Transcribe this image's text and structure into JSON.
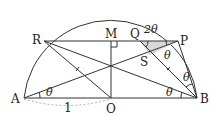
{
  "diagram": {
    "type": "semicircle geometry figure",
    "points": {
      "A": "A",
      "O": "O",
      "B": "B",
      "R": "R",
      "M": "M",
      "Q": "Q",
      "P": "P",
      "S": "S"
    },
    "angle_labels": {
      "at_A": "θ",
      "at_B_lower": "θ",
      "at_B_upper": "θ",
      "at_P": "θ",
      "at_Q": "2θ"
    },
    "length_labels": {
      "AO": "1"
    },
    "shaded_region": "triangle QSP",
    "shade_color": "#d8d8d8",
    "line_color": "#333333"
  }
}
